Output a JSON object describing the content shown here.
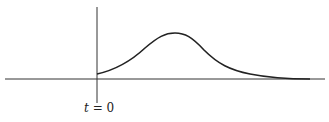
{
  "diagram": {
    "axis_label": "t = 0",
    "axis_var": "t",
    "axis_eq": " = 0",
    "colors": {
      "line": "#222222",
      "background": "#ffffff"
    }
  }
}
